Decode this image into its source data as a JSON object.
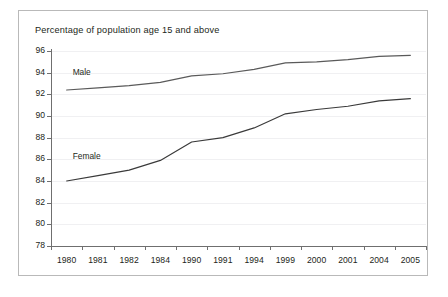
{
  "chart_data": {
    "type": "line",
    "title": "Percentage of population age 15 and above",
    "xlabel": "",
    "ylabel": "",
    "ylim": [
      78,
      96
    ],
    "yticks": [
      78,
      80,
      82,
      84,
      86,
      88,
      90,
      92,
      94,
      96
    ],
    "grid": true,
    "legend_position": "inline-annotation",
    "categories": [
      "1980",
      "1981",
      "1982",
      "1984",
      "1990",
      "1991",
      "1994",
      "1999",
      "2000",
      "2001",
      "2004",
      "2005"
    ],
    "series": [
      {
        "name": "Male",
        "color": "#5a5a5a",
        "values": [
          92.4,
          92.6,
          92.8,
          93.1,
          93.7,
          93.9,
          94.3,
          94.9,
          95.0,
          95.2,
          95.5,
          95.6
        ]
      },
      {
        "name": "Female",
        "color": "#3a3a3a",
        "values": [
          84.0,
          84.5,
          85.0,
          85.9,
          87.6,
          88.0,
          88.9,
          90.2,
          90.6,
          90.9,
          91.4,
          91.6
        ]
      }
    ],
    "annotations": [
      {
        "text": "Male",
        "x_category": "1980",
        "y_value": 94.0
      },
      {
        "text": "Female",
        "x_category": "1980",
        "y_value": 86.2
      }
    ]
  },
  "style": {
    "border_color": "#b9b9b9",
    "axis_color": "#6f6f6f",
    "grid_color": "#f0f0f2",
    "text_color": "#231f20",
    "background": "#ffffff"
  }
}
